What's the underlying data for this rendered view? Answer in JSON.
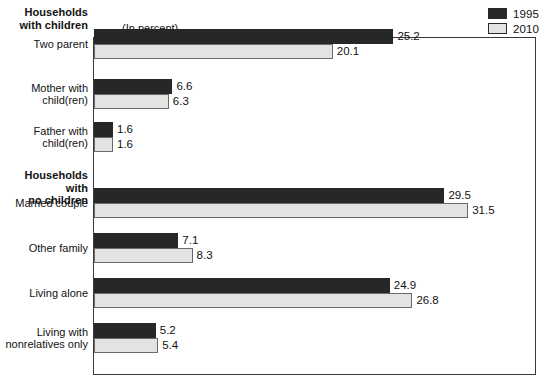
{
  "unit_note": "(In percent)",
  "legend": {
    "items": [
      {
        "label": "1995",
        "color": "#272727",
        "name": "legend-swatch-1995"
      },
      {
        "label": "2010",
        "color": "#e3e3e1",
        "name": "legend-swatch-2010"
      }
    ]
  },
  "sections": [
    {
      "id": "children",
      "label": "Households\nwith children"
    },
    {
      "id": "nochildren",
      "label": "Households with\nno children"
    }
  ],
  "chart_data": {
    "type": "bar",
    "orientation": "horizontal",
    "title": "",
    "subtitle": "(In percent)",
    "xlabel": "",
    "ylabel": "",
    "xlim": [
      0,
      37
    ],
    "grid": false,
    "legend_position": "top-right",
    "categories": [
      "Two parent",
      "Mother with child(ren)",
      "Father with child(ren)",
      "Married couple",
      "Other family",
      "Living alone",
      "Living with nonrelatives only"
    ],
    "series": [
      {
        "name": "1995",
        "color": "#272727",
        "values": [
          25.2,
          6.6,
          1.6,
          29.5,
          7.1,
          24.9,
          5.2
        ]
      },
      {
        "name": "2010",
        "color": "#e3e3e1",
        "values": [
          20.1,
          6.3,
          1.6,
          31.5,
          8.3,
          26.8,
          5.4
        ]
      }
    ],
    "groups": [
      {
        "section": "Households with children",
        "categories": [
          "Two parent",
          "Mother with child(ren)",
          "Father with child(ren)"
        ]
      },
      {
        "section": "Households with no children",
        "categories": [
          "Married couple",
          "Other family",
          "Living alone",
          "Living with nonrelatives only"
        ]
      }
    ]
  },
  "rows": [
    {
      "label": "Two parent",
      "label_display": "Two parent",
      "top": 44,
      "v1995": "25.2",
      "v2010": "20.1"
    },
    {
      "label": "Mother with child(ren)",
      "label_display": "Mother with\nchild(ren)",
      "top": 94,
      "v1995": "6.6",
      "v2010": "6.3"
    },
    {
      "label": "Father with child(ren)",
      "label_display": "Father with\nchild(ren)",
      "top": 137,
      "v1995": "1.6",
      "v2010": "1.6"
    },
    {
      "label": "Married couple",
      "label_display": "Married couple",
      "top": 203,
      "v1995": "29.5",
      "v2010": "31.5"
    },
    {
      "label": "Other family",
      "label_display": "Other family",
      "top": 248,
      "v1995": "7.1",
      "v2010": "8.3"
    },
    {
      "label": "Living alone",
      "label_display": "Living alone",
      "top": 293,
      "v1995": "24.9",
      "v2010": "26.8"
    },
    {
      "label": "Living with nonrelatives only",
      "label_display": "Living with\nnonrelatives only",
      "top": 338,
      "v1995": "5.2",
      "v2010": "5.4"
    }
  ]
}
